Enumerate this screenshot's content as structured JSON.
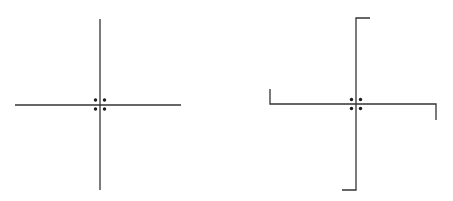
{
  "diagram": {
    "figures": [
      {
        "name": "plain-cross",
        "center": [
          100,
          105
        ],
        "horizontal": [
          15,
          181
        ],
        "vertical": [
          19,
          190
        ],
        "hooks": [],
        "dots": [
          [
            -4.5,
            -4.5
          ],
          [
            4.5,
            -4.5
          ],
          [
            -4.5,
            4.5
          ],
          [
            4.5,
            4.5
          ]
        ]
      },
      {
        "name": "hooked-cross",
        "center": [
          356,
          104
        ],
        "horizontal": [
          270,
          436
        ],
        "vertical": [
          18,
          190
        ],
        "hooks": [
          "top-right",
          "bottom-left",
          "left-up",
          "right-down"
        ],
        "dots": [
          [
            -4.5,
            -4.5
          ],
          [
            4.5,
            -4.5
          ],
          [
            -4.5,
            4.5
          ],
          [
            4.5,
            4.5
          ]
        ]
      }
    ],
    "stroke_color": "#333333",
    "background": "#ffffff"
  }
}
